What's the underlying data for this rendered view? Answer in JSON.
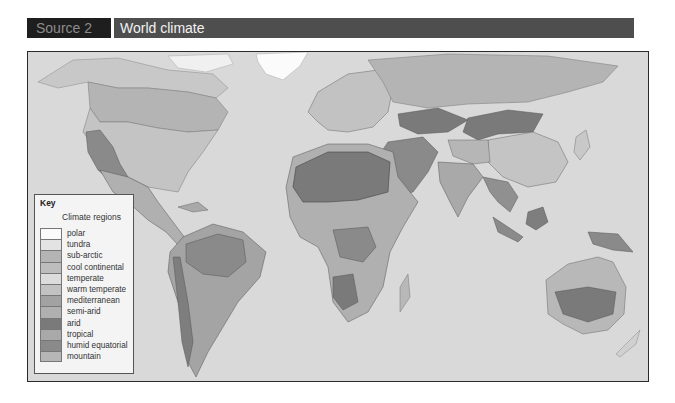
{
  "header": {
    "source_label": "Source 2",
    "title": "World climate"
  },
  "map": {
    "subject": "World climate regions",
    "ocean_color": "#d9d9d9",
    "border_color": "#3a3a3a",
    "legend": {
      "title": "Key",
      "subtitle": "Climate regions",
      "items": [
        {
          "label": "polar",
          "color": "#fbfbfb"
        },
        {
          "label": "tundra",
          "color": "#e3e3e3"
        },
        {
          "label": "sub-arctic",
          "color": "#b4b4b4"
        },
        {
          "label": "cool continental",
          "color": "#bdbdbd"
        },
        {
          "label": "temperate",
          "color": "#dcdcdc"
        },
        {
          "label": "warm temperate",
          "color": "#c2c2c2"
        },
        {
          "label": "mediterranean",
          "color": "#a2a2a2"
        },
        {
          "label": "semi-arid",
          "color": "#b0b0b0"
        },
        {
          "label": "arid",
          "color": "#7a7a7a"
        },
        {
          "label": "tropical",
          "color": "#a9a9a9"
        },
        {
          "label": "humid equatorial",
          "color": "#8a8a8a"
        },
        {
          "label": "mountain",
          "color": "#b6b6b6"
        }
      ]
    }
  }
}
